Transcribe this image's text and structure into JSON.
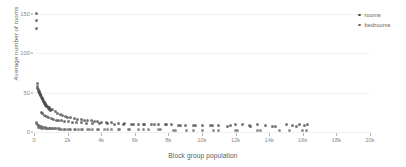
{
  "chart_data": {
    "type": "scatter",
    "title": "",
    "xlabel": "Block group population",
    "ylabel": "Average number of rooms",
    "xlim": [
      0,
      20000
    ],
    "ylim": [
      0,
      160
    ],
    "grid": true,
    "legend_position": "top-right",
    "xticks": [
      0,
      2000,
      4000,
      6000,
      8000,
      10000,
      12000,
      14000,
      16000,
      18000,
      20000
    ],
    "xticklabels": [
      "0",
      "2k",
      "4k",
      "6k",
      "8k",
      "10k",
      "12k",
      "14k",
      "16k",
      "18k",
      "20k"
    ],
    "yticks": [
      0,
      50,
      100,
      150
    ],
    "yticklabels": [
      "0",
      "50",
      "100",
      "150"
    ],
    "series": [
      {
        "name": "rooms",
        "color": "#4a4a4a",
        "points": [
          [
            120,
            151.0
          ],
          [
            150,
            141.5
          ],
          [
            160,
            132.0
          ],
          [
            180,
            61.0
          ],
          [
            210,
            57.5
          ],
          [
            230,
            55.0
          ],
          [
            250,
            53.5
          ],
          [
            270,
            52.0
          ],
          [
            300,
            51.0
          ],
          [
            320,
            50.0
          ],
          [
            340,
            49.0
          ],
          [
            360,
            48.0
          ],
          [
            390,
            47.0
          ],
          [
            410,
            46.0
          ],
          [
            430,
            45.0
          ],
          [
            460,
            44.0
          ],
          [
            480,
            43.0
          ],
          [
            500,
            42.0
          ],
          [
            530,
            41.0
          ],
          [
            560,
            40.0
          ],
          [
            590,
            39.0
          ],
          [
            620,
            38.0
          ],
          [
            650,
            37.0
          ],
          [
            680,
            36.0
          ],
          [
            710,
            35.0
          ],
          [
            740,
            34.0
          ],
          [
            770,
            33.0
          ],
          [
            800,
            32.0
          ],
          [
            840,
            31.0
          ],
          [
            880,
            30.0
          ],
          [
            920,
            29.0
          ],
          [
            960,
            28.0
          ],
          [
            1000,
            27.0
          ],
          [
            600,
            36.5
          ],
          [
            700,
            33.5
          ],
          [
            900,
            30.5
          ],
          [
            1100,
            28.5
          ],
          [
            1250,
            26.0
          ],
          [
            1400,
            24.0
          ],
          [
            1550,
            22.5
          ],
          [
            1700,
            21.0
          ],
          [
            1850,
            20.0
          ],
          [
            2000,
            19.0
          ],
          [
            2200,
            18.0
          ],
          [
            2400,
            17.0
          ],
          [
            2600,
            16.0
          ],
          [
            2800,
            15.5
          ],
          [
            3000,
            15.0
          ],
          [
            3200,
            14.5
          ],
          [
            3400,
            14.0
          ],
          [
            3600,
            13.5
          ],
          [
            3800,
            13.0
          ],
          [
            4000,
            12.5
          ],
          [
            4300,
            12.0
          ],
          [
            4600,
            11.5
          ],
          [
            5000,
            11.0
          ],
          [
            5400,
            10.5
          ],
          [
            5800,
            10.0
          ],
          [
            6200,
            10.0
          ],
          [
            6600,
            9.5
          ],
          [
            7000,
            9.5
          ],
          [
            7400,
            9.0
          ],
          [
            7800,
            9.0
          ],
          [
            8200,
            9.0
          ],
          [
            8600,
            8.5
          ],
          [
            9000,
            8.5
          ],
          [
            9500,
            8.5
          ],
          [
            10000,
            8.0
          ],
          [
            10500,
            8.0
          ],
          [
            11000,
            8.0
          ],
          [
            11500,
            7.5
          ],
          [
            12000,
            10.0
          ],
          [
            12400,
            9.0
          ],
          [
            12800,
            8.0
          ],
          [
            13300,
            9.5
          ],
          [
            13800,
            8.0
          ],
          [
            14400,
            7.5
          ],
          [
            15000,
            9.0
          ],
          [
            15400,
            8.5
          ],
          [
            15800,
            9.5
          ],
          [
            16100,
            8.5
          ],
          [
            16300,
            9.0
          ],
          [
            450,
            25.0
          ],
          [
            520,
            23.0
          ],
          [
            610,
            21.0
          ],
          [
            760,
            19.5
          ],
          [
            880,
            18.0
          ],
          [
            1020,
            17.0
          ],
          [
            1180,
            16.0
          ],
          [
            1320,
            15.0
          ],
          [
            1480,
            14.5
          ],
          [
            1640,
            14.0
          ],
          [
            1820,
            13.5
          ],
          [
            2050,
            13.0
          ],
          [
            2300,
            12.5
          ],
          [
            2550,
            12.0
          ],
          [
            2850,
            11.5
          ],
          [
            3150,
            11.0
          ],
          [
            3500,
            11.0
          ],
          [
            3900,
            10.5
          ],
          [
            4350,
            10.5
          ],
          [
            4800,
            10.0
          ],
          [
            5300,
            10.0
          ],
          [
            5900,
            9.5
          ],
          [
            6500,
            9.5
          ],
          [
            7200,
            9.0
          ],
          [
            7900,
            9.0
          ],
          [
            8700,
            8.5
          ],
          [
            9600,
            8.5
          ],
          [
            10600,
            8.0
          ],
          [
            11700,
            8.0
          ],
          [
            12900,
            7.5
          ],
          [
            14200,
            7.5
          ],
          [
            15600,
            7.5
          ]
        ]
      },
      {
        "name": "bedrooms",
        "color": "#6e6e6e",
        "points": [
          [
            130,
            12.0
          ],
          [
            170,
            10.5
          ],
          [
            200,
            9.5
          ],
          [
            240,
            8.5
          ],
          [
            280,
            8.0
          ],
          [
            320,
            7.5
          ],
          [
            370,
            7.0
          ],
          [
            420,
            6.5
          ],
          [
            470,
            6.0
          ],
          [
            530,
            5.8
          ],
          [
            600,
            5.5
          ],
          [
            670,
            5.2
          ],
          [
            750,
            5.0
          ],
          [
            830,
            4.8
          ],
          [
            920,
            4.6
          ],
          [
            1010,
            4.5
          ],
          [
            1120,
            4.3
          ],
          [
            1240,
            4.2
          ],
          [
            1370,
            4.0
          ],
          [
            1510,
            3.9
          ],
          [
            1660,
            3.8
          ],
          [
            1820,
            3.7
          ],
          [
            2000,
            3.6
          ],
          [
            2200,
            3.5
          ],
          [
            2400,
            3.4
          ],
          [
            2650,
            3.3
          ],
          [
            2900,
            3.2
          ],
          [
            3200,
            3.1
          ],
          [
            3500,
            3.0
          ],
          [
            3850,
            3.0
          ],
          [
            4200,
            2.9
          ],
          [
            4600,
            2.8
          ],
          [
            5100,
            2.8
          ],
          [
            5600,
            2.7
          ],
          [
            6200,
            2.7
          ],
          [
            6800,
            2.6
          ],
          [
            7500,
            2.6
          ],
          [
            8300,
            2.5
          ],
          [
            9100,
            2.5
          ],
          [
            10000,
            2.4
          ],
          [
            11000,
            2.4
          ],
          [
            12100,
            2.3
          ],
          [
            13300,
            2.3
          ],
          [
            14600,
            2.2
          ],
          [
            16000,
            2.2
          ],
          [
            250,
            6.0
          ],
          [
            340,
            5.5
          ],
          [
            450,
            5.0
          ],
          [
            580,
            4.8
          ],
          [
            730,
            4.5
          ],
          [
            900,
            4.3
          ],
          [
            1090,
            4.1
          ],
          [
            1300,
            3.9
          ],
          [
            1540,
            3.8
          ],
          [
            1800,
            3.6
          ],
          [
            2100,
            3.5
          ],
          [
            2450,
            3.4
          ],
          [
            2850,
            3.2
          ],
          [
            3300,
            3.1
          ],
          [
            3800,
            3.0
          ],
          [
            4400,
            2.9
          ],
          [
            5000,
            2.8
          ],
          [
            5700,
            2.7
          ],
          [
            6500,
            2.6
          ],
          [
            7400,
            2.6
          ],
          [
            8400,
            2.5
          ],
          [
            9500,
            2.4
          ],
          [
            10700,
            2.4
          ],
          [
            12000,
            2.3
          ],
          [
            13500,
            2.2
          ],
          [
            15200,
            2.2
          ],
          [
            16200,
            2.1
          ]
        ]
      }
    ]
  },
  "legend": {
    "items": [
      {
        "label": "rooms"
      },
      {
        "label": "bedrooms"
      }
    ]
  }
}
